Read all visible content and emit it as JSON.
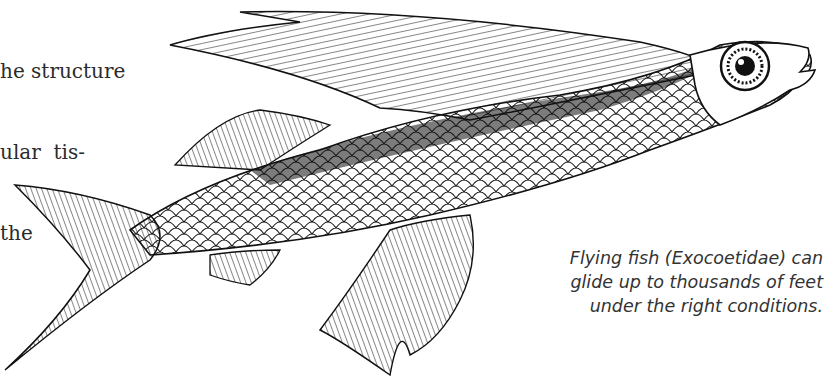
{
  "body_text": {
    "lines": [
      "he structure",
      "ular  tis-",
      "the"
    ]
  },
  "illustration": {
    "subject": "flying-fish-engraving",
    "ink_color": "#111111"
  },
  "caption": {
    "lines": [
      "Flying fish (Exocoetidae) can",
      "glide up to thousands of feet",
      "under the right conditions."
    ]
  }
}
